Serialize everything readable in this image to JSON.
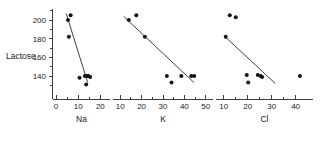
{
  "figure": {
    "ylabel": "Lactose",
    "background": "#ffffff",
    "ink_color": "#141414"
  },
  "chart_data": {
    "type": "scatter",
    "title": "",
    "ylabel": "Lactose",
    "ylim": [
      128,
      212
    ],
    "yticks": [
      140,
      160,
      180,
      200
    ],
    "ytick_labels": [
      "140",
      "160",
      "180",
      "200"
    ],
    "grid": false,
    "legend": null,
    "panels": [
      {
        "name": "sodium-panel",
        "xlabel": "Na",
        "xlim": [
          0,
          23
        ],
        "xticks": [
          0,
          10,
          20
        ],
        "xtick_labels": [
          "0",
          "10",
          "20"
        ],
        "minor_xticks": [
          5,
          15
        ],
        "points": [
          {
            "x": 6.6,
            "y": 205
          },
          {
            "x": 5.4,
            "y": 200
          },
          {
            "x": 5.8,
            "y": 182
          },
          {
            "x": 10.6,
            "y": 138
          },
          {
            "x": 13.0,
            "y": 140
          },
          {
            "x": 13.9,
            "y": 140
          },
          {
            "x": 14.6,
            "y": 140
          },
          {
            "x": 15.4,
            "y": 139
          },
          {
            "x": 13.6,
            "y": 131
          }
        ],
        "fit_line": {
          "x1": 4.6,
          "y1": 207,
          "x2": 14.3,
          "y2": 133
        }
      },
      {
        "name": "potassium-panel",
        "xlabel": "K",
        "xlim": [
          8,
          52
        ],
        "xticks": [
          10,
          20,
          30,
          40,
          50
        ],
        "xtick_labels": [
          "10",
          "20",
          "30",
          "40",
          "50"
        ],
        "minor_xticks": [
          15,
          25,
          35,
          45
        ],
        "points": [
          {
            "x": 17.5,
            "y": 205
          },
          {
            "x": 14.0,
            "y": 200
          },
          {
            "x": 21.5,
            "y": 182
          },
          {
            "x": 31.8,
            "y": 140
          },
          {
            "x": 38.6,
            "y": 140
          },
          {
            "x": 43.2,
            "y": 140
          },
          {
            "x": 44.6,
            "y": 140
          },
          {
            "x": 34.0,
            "y": 133
          }
        ],
        "fit_line": {
          "x1": 11.5,
          "y1": 204,
          "x2": 44.5,
          "y2": 133
        }
      },
      {
        "name": "chloride-panel",
        "xlabel": "Cl",
        "xlim": [
          8,
          46
        ],
        "xticks": [
          10,
          20,
          30,
          40
        ],
        "xtick_labels": [
          "10",
          "20",
          "30",
          "40"
        ],
        "minor_xticks": [
          15,
          25,
          35
        ],
        "points": [
          {
            "x": 12.5,
            "y": 205
          },
          {
            "x": 15.0,
            "y": 203
          },
          {
            "x": 10.8,
            "y": 182
          },
          {
            "x": 19.6,
            "y": 141
          },
          {
            "x": 24.2,
            "y": 141
          },
          {
            "x": 25.4,
            "y": 140
          },
          {
            "x": 26.0,
            "y": 139
          },
          {
            "x": 20.2,
            "y": 133
          },
          {
            "x": 41.8,
            "y": 140
          }
        ],
        "fit_line": {
          "x1": 11.0,
          "y1": 181,
          "x2": 31.5,
          "y2": 132
        }
      }
    ]
  }
}
